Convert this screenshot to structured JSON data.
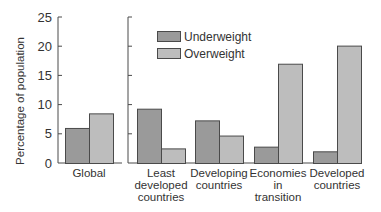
{
  "chart_data": {
    "type": "bar",
    "title": "",
    "xlabel": "",
    "ylabel": "Percentage of population",
    "ylim": [
      0,
      25
    ],
    "yticks": [
      0,
      5,
      10,
      15,
      20,
      25
    ],
    "grid": false,
    "legend_position": "upper-left of right panel",
    "categories": [
      "Global",
      "Least developed countries",
      "Developing countries",
      "Economies in transition",
      "Developed countries"
    ],
    "category_label_lines": [
      [
        "Global"
      ],
      [
        "Least",
        "developed",
        "countries"
      ],
      [
        "Developing",
        "countries"
      ],
      [
        "Economies",
        "in",
        "transition"
      ],
      [
        "Developed",
        "countries"
      ]
    ],
    "series": [
      {
        "name": "Underweight",
        "color": "#9a9a9a",
        "values": [
          6,
          9.3,
          7.3,
          2.8,
          2
        ]
      },
      {
        "name": "Overweight",
        "color": "#bdbdbd",
        "values": [
          8.5,
          2.5,
          4.7,
          17,
          20.1
        ]
      }
    ],
    "panels": [
      {
        "name": "global",
        "categories": [
          "Global"
        ]
      },
      {
        "name": "by-development",
        "categories": [
          "Least developed countries",
          "Developing countries",
          "Economies in transition",
          "Developed countries"
        ]
      }
    ]
  }
}
